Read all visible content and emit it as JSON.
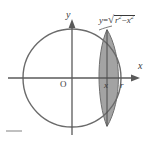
{
  "figure": {
    "kind": "math-diagram",
    "description_label": "circle-with-shaded-cross-section",
    "background_color": "#ffffff",
    "stroke_color": "#6b6b6b",
    "axis_color": "#5a5a5a",
    "shade_fill_color": "#9b9b9b",
    "text_color": "#3a3a3a",
    "labels": {
      "y_axis": "y",
      "x_axis": "x",
      "origin": "O",
      "slice_x": "x",
      "radius": "r"
    },
    "equation": {
      "lhs": "y",
      "operator": "=",
      "radicand_first": "r",
      "radicand_first_exponent": "2",
      "radicand_minus": "−",
      "radicand_second": "x",
      "radicand_second_exponent": "2",
      "plain_text": "y = √(r² − x²)"
    },
    "geometry": {
      "circle_center_x": 72,
      "circle_center_y": 78,
      "circle_radius": 49,
      "slice_left_x": 99,
      "slice_right_x": 118,
      "slice_line_x": 107,
      "x_axis_y": 78,
      "y_axis_x": 72
    }
  }
}
